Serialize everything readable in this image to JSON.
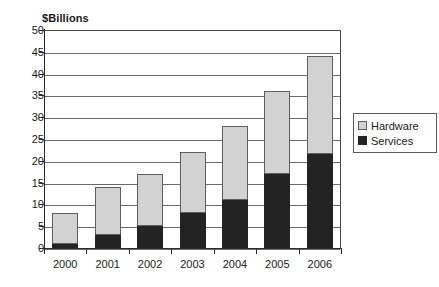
{
  "chart_data": {
    "type": "bar",
    "stacked": true,
    "title": "",
    "subtitle": "",
    "xlabel": "",
    "ylabel": "$Billions",
    "categories": [
      "2000",
      "2001",
      "2002",
      "2003",
      "2004",
      "2005",
      "2006"
    ],
    "series": [
      {
        "name": "Services",
        "values": [
          1,
          3,
          5,
          8,
          11,
          17,
          21.5
        ],
        "color": "#232323"
      },
      {
        "name": "Hardware",
        "values": [
          7,
          11,
          12,
          14,
          17,
          19,
          22.5
        ],
        "color": "#d2d2d2"
      }
    ],
    "totals": [
      8,
      14,
      17,
      22,
      28,
      36,
      44
    ],
    "ylim": [
      0,
      50
    ],
    "ytick_step": 5,
    "yticks": [
      "50",
      "45",
      "40",
      "35",
      "30",
      "25",
      "20",
      "15",
      "10",
      "5",
      "0"
    ],
    "grid": true,
    "legend_position": "right",
    "legend": [
      "Hardware",
      "Services"
    ]
  },
  "legend": {
    "items": [
      {
        "label": "Hardware",
        "swatch": "hardware-swatch"
      },
      {
        "label": "Services",
        "swatch": "services-swatch"
      }
    ]
  }
}
